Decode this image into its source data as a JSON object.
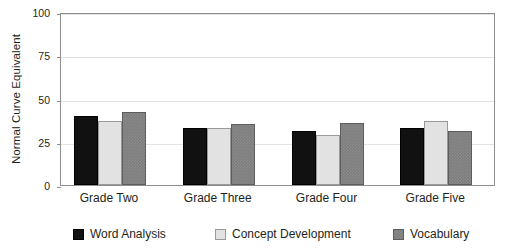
{
  "chart_data": {
    "type": "bar",
    "title": "",
    "xlabel": "",
    "ylabel": "Normal Curve Equivalent",
    "ylim": [
      0,
      100
    ],
    "yticks": [
      "0",
      "25",
      "50",
      "75",
      "100"
    ],
    "ytick_values": [
      0,
      25,
      50,
      75,
      100
    ],
    "grid": true,
    "legend_position": "bottom",
    "categories": [
      "Grade Two",
      "Grade Three",
      "Grade Four",
      "Grade Five"
    ],
    "series": [
      {
        "name": "Word Analysis",
        "color": "#111111",
        "values": [
          40,
          33,
          31,
          33
        ]
      },
      {
        "name": "Concept Development",
        "color": "#e2e2e2",
        "values": [
          37,
          33,
          29,
          37
        ]
      },
      {
        "name": "Vocabulary",
        "color": "#7d7d7d",
        "values": [
          42,
          35,
          36,
          31
        ]
      }
    ]
  }
}
